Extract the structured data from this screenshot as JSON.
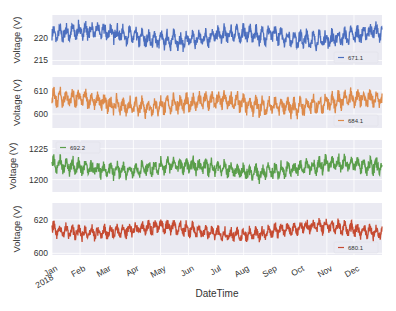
{
  "chart_data": [
    {
      "type": "line",
      "series": [
        {
          "name": "671.1",
          "color": "#4c6fbf"
        }
      ],
      "ylabel": "Voltage (V)",
      "yticks": [
        215,
        220
      ],
      "ylim": [
        214,
        225
      ],
      "legend": {
        "label": "671.1",
        "position": "lower right"
      },
      "baseline": 220.5,
      "amplitude": 3.2,
      "trend_amp": 1.0
    },
    {
      "type": "line",
      "series": [
        {
          "name": "684.1",
          "color": "#dd8a4a"
        }
      ],
      "ylabel": "Voltage (V)",
      "yticks": [
        600,
        610
      ],
      "ylim": [
        594,
        616
      ],
      "legend": {
        "label": "684.1",
        "position": "lower right"
      },
      "baseline": 605,
      "amplitude": 6.5,
      "trend_amp": 2.0
    },
    {
      "type": "line",
      "series": [
        {
          "name": "692.2",
          "color": "#5a9e4b"
        }
      ],
      "ylabel": "Voltage (V)",
      "yticks": [
        1200,
        1225
      ],
      "ylim": [
        1190,
        1232
      ],
      "legend": {
        "label": "692.2",
        "position": "upper left"
      },
      "baseline": 1210,
      "amplitude": 11,
      "trend_amp": 3.0
    },
    {
      "type": "line",
      "series": [
        {
          "name": "680.1",
          "color": "#c64b32"
        }
      ],
      "ylabel": "Voltage (V)",
      "yticks": [
        600,
        620
      ],
      "ylim": [
        599,
        630
      ],
      "legend": {
        "label": "680.1",
        "position": "lower right"
      },
      "baseline": 614,
      "amplitude": 7,
      "trend_amp": 2.0
    }
  ],
  "shared_x": {
    "xlabel": "DateTime",
    "ticks": [
      "Jan\n2018",
      "Feb",
      "Mar",
      "Apr",
      "May",
      "Jun",
      "Jul",
      "Aug",
      "Sep",
      "Oct",
      "Nov",
      "Dec"
    ],
    "range": [
      "2018-01-01",
      "2018-12-31"
    ],
    "grid": true
  }
}
